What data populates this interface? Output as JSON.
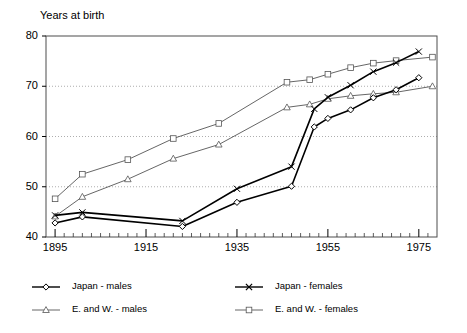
{
  "chart_data": {
    "type": "line",
    "title": "Years at birth",
    "xlabel": "",
    "ylabel": "Years at birth",
    "xlim": [
      1893,
      1979
    ],
    "ylim": [
      40,
      80
    ],
    "xticks": [
      1895,
      1915,
      1935,
      1955,
      1975
    ],
    "yticks": [
      40,
      50,
      60,
      70,
      80
    ],
    "minor_xtick_interval": 2,
    "grid": "horizontal-dotted",
    "legend_position": "bottom",
    "series": [
      {
        "name": "Japan - males",
        "marker": "diamond",
        "color": "#000000",
        "line_width": 1.6,
        "points": [
          [
            1895,
            42.8
          ],
          [
            1901,
            44.0
          ],
          [
            1923,
            42.1
          ],
          [
            1935,
            46.9
          ],
          [
            1947,
            50.1
          ],
          [
            1952,
            61.9
          ],
          [
            1955,
            63.6
          ],
          [
            1960,
            65.3
          ],
          [
            1965,
            67.7
          ],
          [
            1970,
            69.3
          ],
          [
            1975,
            71.7
          ]
        ]
      },
      {
        "name": "Japan - females",
        "marker": "cross",
        "color": "#000000",
        "line_width": 1.6,
        "points": [
          [
            1895,
            44.3
          ],
          [
            1901,
            44.9
          ],
          [
            1923,
            43.2
          ],
          [
            1935,
            49.6
          ],
          [
            1947,
            54.0
          ],
          [
            1952,
            65.5
          ],
          [
            1955,
            67.8
          ],
          [
            1960,
            70.2
          ],
          [
            1965,
            72.9
          ],
          [
            1970,
            74.7
          ],
          [
            1975,
            76.9
          ]
        ]
      },
      {
        "name": "E. and W. - males",
        "marker": "triangle",
        "color": "#555555",
        "line_width": 0.9,
        "points": [
          [
            1895,
            44.1
          ],
          [
            1901,
            48.0
          ],
          [
            1911,
            51.5
          ],
          [
            1921,
            55.6
          ],
          [
            1931,
            58.4
          ],
          [
            1946,
            65.8
          ],
          [
            1951,
            66.4
          ],
          [
            1955,
            67.5
          ],
          [
            1960,
            68.1
          ],
          [
            1965,
            68.5
          ],
          [
            1970,
            68.8
          ],
          [
            1978,
            70.0
          ]
        ]
      },
      {
        "name": "E. and W. - females",
        "marker": "square",
        "color": "#555555",
        "line_width": 0.9,
        "points": [
          [
            1895,
            47.6
          ],
          [
            1901,
            52.5
          ],
          [
            1911,
            55.4
          ],
          [
            1921,
            59.6
          ],
          [
            1931,
            62.6
          ],
          [
            1946,
            70.8
          ],
          [
            1951,
            71.3
          ],
          [
            1955,
            72.4
          ],
          [
            1960,
            73.7
          ],
          [
            1965,
            74.6
          ],
          [
            1970,
            75.1
          ],
          [
            1978,
            75.8
          ]
        ]
      }
    ]
  },
  "legend": {
    "items": [
      {
        "label": "Japan - males",
        "marker": "diamond"
      },
      {
        "label": "Japan - females",
        "marker": "cross"
      },
      {
        "label": "E. and W. - males",
        "marker": "triangle"
      },
      {
        "label": "E. and W. - females",
        "marker": "square"
      }
    ]
  }
}
